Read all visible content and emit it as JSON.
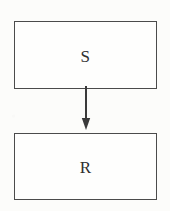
{
  "diagram": {
    "background_color": "#fcfcfa",
    "line_color": "#4b4b4b",
    "text_color": "#2f2f2f",
    "nodes": [
      {
        "id": "S",
        "label": "S",
        "shape": "rectangle",
        "x": 14,
        "y": 21,
        "width": 143,
        "height": 68
      },
      {
        "id": "R",
        "label": "R",
        "shape": "rectangle",
        "x": 14,
        "y": 133,
        "width": 143,
        "height": 67
      }
    ],
    "edges": [
      {
        "id": "s-to-r",
        "from": "S",
        "to": "R",
        "label": "",
        "style": "solid",
        "arrowhead": "filled-triangle",
        "direction": "down"
      }
    ]
  }
}
